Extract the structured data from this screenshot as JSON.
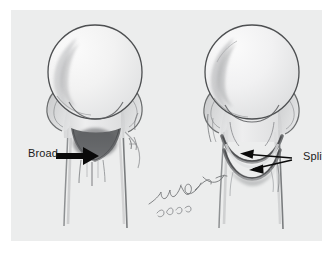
{
  "figure": {
    "medium": "pencil-drawing",
    "background_color": "#ffffff",
    "paper_color": "#eceded",
    "ink_color": "#1b1b1b",
    "shading_color": "#6f7173",
    "dark_shading_color": "#4d4f51",
    "title": "",
    "caption": ""
  },
  "annotations": [
    {
      "id": "broad",
      "label": "Broad",
      "arrow": "arrow-right",
      "points_to": "left-figure-broad-shaded-region",
      "color": "#0a0a0a"
    },
    {
      "id": "split",
      "label": "Split",
      "arrow": "arrow-left-double",
      "points_to": "right-figure-split-bands",
      "color": "#0a0a0a"
    }
  ],
  "signature": {
    "name": "M. Park",
    "year": "2006"
  },
  "panels": [
    {
      "id": "left-figure",
      "name": "femoral-head-broad-view",
      "features": [
        "femoral-head-circle",
        "femoral-neck",
        "femoral-shaft",
        "broad-shaded-area"
      ]
    },
    {
      "id": "right-figure",
      "name": "femoral-head-split-view",
      "features": [
        "femoral-head-circle",
        "femoral-neck",
        "femoral-shaft",
        "split-band-upper",
        "split-band-lower"
      ]
    }
  ]
}
